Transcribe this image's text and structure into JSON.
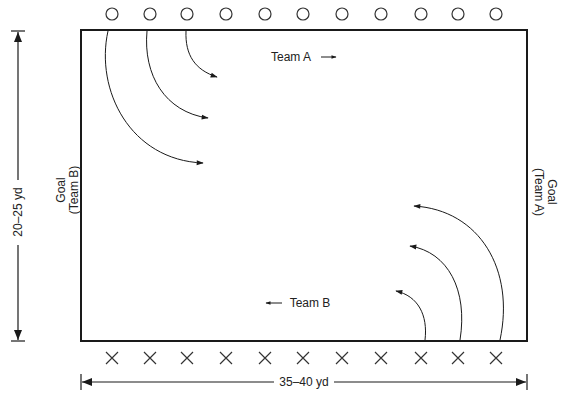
{
  "diagram": {
    "title": "",
    "field": {
      "width_label": "35–40 yd",
      "height_label": "20–25 yd",
      "left_goal": {
        "line1": "Goal",
        "line2": "(Team B)"
      },
      "right_goal": {
        "line1": "Goal",
        "line2": "(Team A)"
      },
      "border_color": "#1a1a1a"
    },
    "teams": {
      "team_a": {
        "label": "Team A",
        "direction": "right",
        "marker": "circle",
        "count": 11
      },
      "team_b": {
        "label": "Team B",
        "direction": "left",
        "marker": "cross",
        "count": 11
      }
    },
    "player_x_positions": [
      112,
      150,
      187,
      226,
      265,
      303,
      342,
      381,
      421,
      458,
      496
    ],
    "runs": {
      "team_a_arcs": 3,
      "team_b_arcs": 3
    },
    "colors": {
      "line": "#1a1a1a",
      "background": "#ffffff",
      "marker": "#333333"
    }
  }
}
